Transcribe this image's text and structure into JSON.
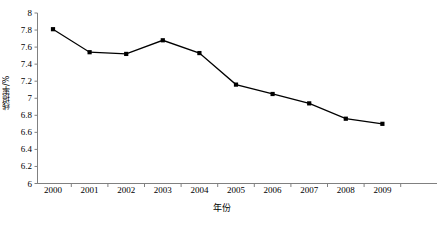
{
  "chart_data": {
    "type": "line",
    "title": "",
    "xlabel": "年份",
    "ylabel": "线损率/%",
    "categories": [
      "2000",
      "2001",
      "2002",
      "2003",
      "2004",
      "2005",
      "2006",
      "2007",
      "2008",
      "2009"
    ],
    "values": [
      7.81,
      7.54,
      7.52,
      7.68,
      7.53,
      7.16,
      7.05,
      6.94,
      6.76,
      6.7
    ],
    "series": [
      {
        "name": "线损率",
        "values": [
          7.81,
          7.54,
          7.52,
          7.68,
          7.53,
          7.16,
          7.05,
          6.94,
          6.76,
          6.7
        ]
      }
    ],
    "ylim": [
      6,
      8
    ],
    "ytick_labels": [
      "8",
      "7.8",
      "7.6",
      "7.4",
      "7.2",
      "7",
      "6.8",
      "6.6",
      "6.4",
      "6.2",
      "6"
    ],
    "ytick_values": [
      8,
      7.8,
      7.6,
      7.4,
      7.2,
      7,
      6.8,
      6.6,
      6.4,
      6.2,
      6
    ],
    "grid": false,
    "legend": "none",
    "line_color": "#000000",
    "marker_color": "#000000",
    "marker_shape": "square",
    "axis_color": "#808080",
    "background_color": "#ffffff"
  }
}
